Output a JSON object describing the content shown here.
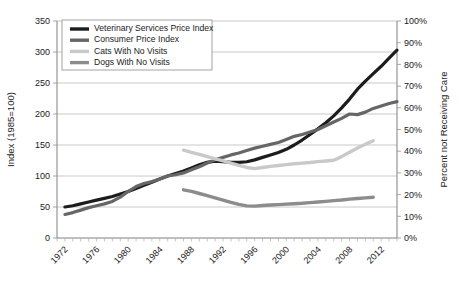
{
  "chart_data": {
    "type": "line",
    "title": "",
    "subtitle": "",
    "xlabel": "",
    "ylabel": "Index (1985=100)",
    "y2label": "Percent not Receiving Care",
    "xlim": [
      1971,
      2014
    ],
    "ylim": [
      0,
      350
    ],
    "y2lim": [
      0,
      100
    ],
    "ytick_values": [
      0,
      50,
      100,
      150,
      200,
      250,
      300,
      350
    ],
    "ytick_labels": [
      "0",
      "50",
      "100",
      "150",
      "200",
      "250",
      "300",
      "350"
    ],
    "y2tick_values": [
      0,
      10,
      20,
      30,
      40,
      50,
      60,
      70,
      80,
      90,
      100
    ],
    "y2tick_labels": [
      "0%",
      "10%",
      "20%",
      "30%",
      "40%",
      "50%",
      "60%",
      "70%",
      "80%",
      "90%",
      "100%"
    ],
    "xtick_values": [
      1972,
      1976,
      1980,
      1984,
      1988,
      1992,
      1996,
      2000,
      2004,
      2008,
      2012
    ],
    "xtick_labels": [
      "1972",
      "1976",
      "1980",
      "1984",
      "1988",
      "1992",
      "1996",
      "2000",
      "2004",
      "2008",
      "2012"
    ],
    "xtick_minor_step": 1,
    "grid": "horizontal",
    "legend_position": "top-left",
    "series": [
      {
        "name": "Veterinary Services Price Index",
        "axis": "left",
        "color": "#1c1c1c",
        "width": 3.2,
        "x": [
          1972,
          1973,
          1974,
          1975,
          1976,
          1977,
          1978,
          1979,
          1980,
          1981,
          1982,
          1983,
          1984,
          1985,
          1986,
          1987,
          1988,
          1989,
          1990,
          1991,
          1992,
          1993,
          1994,
          1995,
          1996,
          1997,
          1998,
          1999,
          2000,
          2001,
          2002,
          2003,
          2004,
          2005,
          2006,
          2007,
          2008,
          2009,
          2010,
          2011,
          2012,
          2013,
          2014
        ],
        "values": [
          50,
          52,
          55,
          58,
          61,
          64,
          67,
          71,
          75,
          80,
          85,
          90,
          95,
          100,
          104,
          108,
          113,
          118,
          122,
          124,
          123,
          122,
          122,
          123,
          126,
          130,
          134,
          138,
          143,
          150,
          158,
          167,
          176,
          186,
          197,
          210,
          224,
          240,
          253,
          265,
          277,
          290,
          303
        ]
      },
      {
        "name": "Consumer Price Index",
        "axis": "left",
        "color": "#666666",
        "width": 3.2,
        "x": [
          1972,
          1973,
          1974,
          1975,
          1976,
          1977,
          1978,
          1979,
          1980,
          1981,
          1982,
          1983,
          1984,
          1985,
          1986,
          1987,
          1988,
          1989,
          1990,
          1991,
          1992,
          1993,
          1994,
          1995,
          1996,
          1997,
          1998,
          1999,
          2000,
          2001,
          2002,
          2003,
          2004,
          2005,
          2006,
          2007,
          2008,
          2009,
          2010,
          2011,
          2012,
          2013,
          2014
        ],
        "values": [
          38,
          41,
          45,
          49,
          52,
          55,
          59,
          66,
          75,
          83,
          88,
          91,
          95,
          100,
          102,
          105,
          110,
          115,
          121,
          126,
          130,
          134,
          137,
          141,
          145,
          148,
          151,
          154,
          159,
          164,
          167,
          171,
          175,
          181,
          187,
          193,
          200,
          199,
          203,
          209,
          213,
          217,
          220
        ]
      },
      {
        "name": "Cats With No Visits",
        "axis": "right",
        "color": "#c9c9c9",
        "width": 3.4,
        "x": [
          1987,
          1988,
          1989,
          1990,
          1991,
          1992,
          1993,
          1994,
          1995,
          1996,
          1997,
          1998,
          1999,
          2000,
          2001,
          2002,
          2003,
          2004,
          2005,
          2006,
          2007,
          2008,
          2009,
          2010,
          2011
        ],
        "values": [
          40.5,
          39.5,
          38.5,
          37.5,
          36.5,
          35.5,
          34.5,
          33.5,
          32.5,
          32.0,
          32.5,
          33.0,
          33.4,
          33.8,
          34.2,
          34.5,
          34.8,
          35.2,
          35.5,
          35.8,
          37.5,
          39.5,
          41.5,
          43.2,
          44.8
        ]
      },
      {
        "name": "Dogs With No Visits",
        "axis": "right",
        "color": "#8c8c8c",
        "width": 3.4,
        "x": [
          1987,
          1988,
          1989,
          1990,
          1991,
          1992,
          1993,
          1994,
          1995,
          1996,
          1997,
          1998,
          1999,
          2000,
          2001,
          2002,
          2003,
          2004,
          2005,
          2006,
          2007,
          2008,
          2009,
          2010,
          2011
        ],
        "values": [
          22.2,
          21.5,
          20.5,
          19.5,
          18.5,
          17.5,
          16.4,
          15.5,
          14.8,
          14.7,
          15.0,
          15.2,
          15.4,
          15.6,
          15.8,
          16.0,
          16.3,
          16.6,
          16.9,
          17.2,
          17.5,
          17.9,
          18.2,
          18.5,
          18.8
        ]
      }
    ],
    "legend_entries": [
      {
        "label": "Veterinary Services Price Index",
        "color": "#1c1c1c"
      },
      {
        "label": "Consumer Price Index",
        "color": "#666666"
      },
      {
        "label": "Cats With No Visits",
        "color": "#c9c9c9"
      },
      {
        "label": "Dogs With No Visits",
        "color": "#8c8c8c"
      }
    ]
  }
}
